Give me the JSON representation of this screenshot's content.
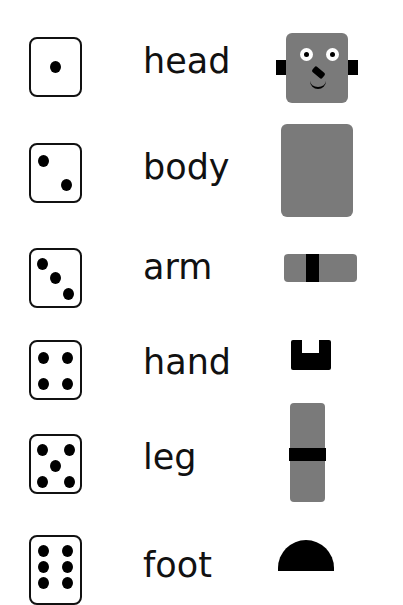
{
  "rows": [
    {
      "dice": 1,
      "word": "head",
      "part": "head"
    },
    {
      "dice": 2,
      "word": "body",
      "part": "body"
    },
    {
      "dice": 3,
      "word": "arm",
      "part": "arm"
    },
    {
      "dice": 4,
      "word": "hand",
      "part": "hand"
    },
    {
      "dice": 5,
      "word": "leg",
      "part": "leg"
    },
    {
      "dice": 6,
      "word": "foot",
      "part": "foot"
    }
  ],
  "colors": {
    "part_gray": "#7a7a7a",
    "dark": "#000000"
  }
}
